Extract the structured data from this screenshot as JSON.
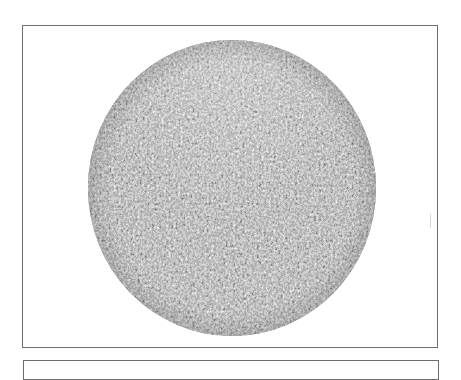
{
  "figure": {
    "pattern_colors": {
      "dark": "#2a2a2a",
      "mid": "#8a8a8a",
      "light": "#e6e6e6",
      "frame_border": "#6e6e6e",
      "background": "#ffffff"
    }
  },
  "next_figure": {
    "description": "Top border of following figure frame (partially visible)"
  }
}
